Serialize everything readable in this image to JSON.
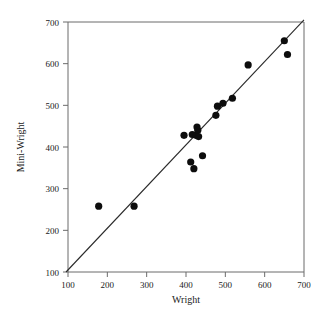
{
  "chart_data": {
    "type": "scatter",
    "title": "",
    "xlabel": "Wright",
    "ylabel": "Mini-Wright",
    "xlim": [
      100,
      700
    ],
    "ylim": [
      100,
      700
    ],
    "xticks": [
      100,
      200,
      300,
      400,
      500,
      600,
      700
    ],
    "yticks": [
      100,
      200,
      300,
      400,
      500,
      600,
      700
    ],
    "xtick_labels": [
      "100",
      "200",
      "300",
      "400",
      "500",
      "600",
      "700"
    ],
    "ytick_labels": [
      "100",
      "200",
      "300",
      "400",
      "500",
      "600",
      "700"
    ],
    "grid": false,
    "legend": null,
    "series": [
      {
        "name": "measurements",
        "marker": "filled-circle",
        "color": "#0d0d0d",
        "points": [
          [
            178,
            258
          ],
          [
            268,
            258
          ],
          [
            395,
            428
          ],
          [
            416,
            430
          ],
          [
            425,
            428
          ],
          [
            428,
            448
          ],
          [
            430,
            440
          ],
          [
            432,
            425
          ],
          [
            412,
            364
          ],
          [
            420,
            348
          ],
          [
            442,
            379
          ],
          [
            476,
            476
          ],
          [
            480,
            498
          ],
          [
            494,
            505
          ],
          [
            518,
            517
          ],
          [
            558,
            597
          ],
          [
            650,
            655
          ],
          [
            658,
            622
          ]
        ]
      }
    ],
    "reference_line": {
      "name": "identity-line",
      "from": [
        95,
        100
      ],
      "to": [
        700,
        705
      ],
      "color": "#2a2a2a"
    }
  }
}
